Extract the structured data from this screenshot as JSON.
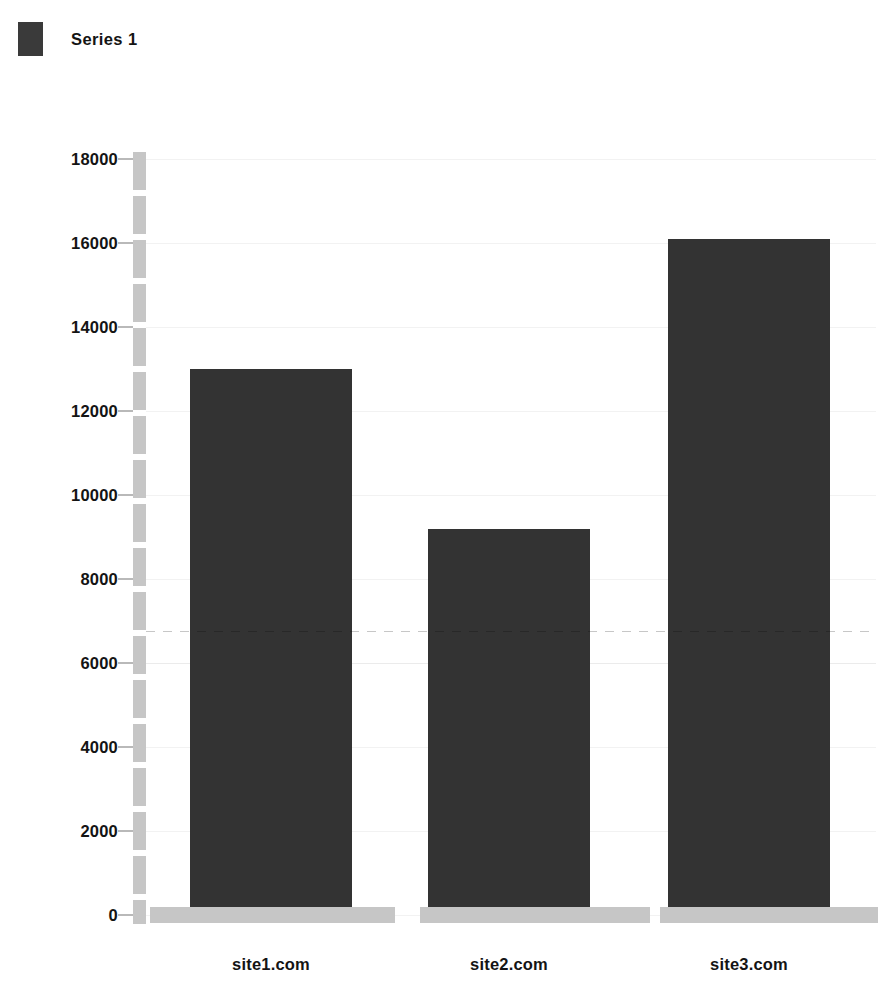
{
  "chart_data": {
    "type": "bar",
    "title": "",
    "subtitle": "",
    "xlabel": "",
    "ylabel": "",
    "categories": [
      "site1.com",
      "site2.com",
      "site3.com"
    ],
    "series": [
      {
        "name": "Series 1",
        "color": "#333333",
        "values": [
          13000,
          9200,
          16100
        ]
      }
    ],
    "values": [
      13000,
      9200,
      16100
    ],
    "ylim": [
      0,
      18000
    ],
    "ytick_step": 2000,
    "yticks": [
      0,
      2000,
      4000,
      6000,
      8000,
      10000,
      12000,
      14000,
      16000,
      18000
    ],
    "ytick_labels": [
      "0",
      "2000",
      "4000",
      "6000",
      "8000",
      "10000",
      "12000",
      "14000",
      "16000",
      "18000"
    ],
    "grid": true,
    "grid_axis": "y",
    "legend_position": "top-left",
    "background_color": "#ffffff",
    "axis_color": "#c6c6c6",
    "text_color": "#141414"
  },
  "legend": {
    "entries": [
      {
        "label": "Series 1",
        "color": "#333333",
        "swatch_icon": "legend-swatch-icon"
      }
    ]
  },
  "axes": {
    "y": {
      "ticks": [
        {
          "value": 18000,
          "label": "18000"
        },
        {
          "value": 16000,
          "label": "16000"
        },
        {
          "value": 14000,
          "label": "14000"
        },
        {
          "value": 12000,
          "label": "12000"
        },
        {
          "value": 10000,
          "label": "10000"
        },
        {
          "value": 8000,
          "label": "8000"
        },
        {
          "value": 6000,
          "label": "6000"
        },
        {
          "value": 4000,
          "label": "4000"
        },
        {
          "value": 2000,
          "label": "2000"
        },
        {
          "value": 0,
          "label": "0"
        }
      ]
    },
    "x": {
      "ticks": [
        {
          "label": "site1.com"
        },
        {
          "label": "site2.com"
        },
        {
          "label": "site3.com"
        }
      ]
    }
  }
}
